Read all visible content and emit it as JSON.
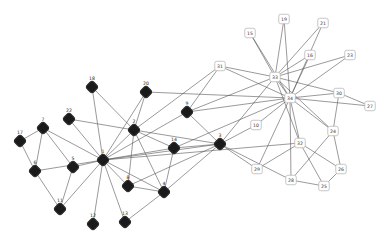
{
  "diagram": {
    "type": "network-graph",
    "colors": {
      "faction_a_fill": "#1a1a1a",
      "faction_b_fill": "#ffffff",
      "faction_b_border": "#b8b8b8",
      "edge": "#555555",
      "background": "#ffffff"
    },
    "nodes": [
      {
        "id": "1",
        "x": 103,
        "y": 160,
        "group": "dark"
      },
      {
        "id": "2",
        "x": 134,
        "y": 130,
        "group": "dark"
      },
      {
        "id": "3",
        "x": 220,
        "y": 144,
        "group": "dark"
      },
      {
        "id": "4",
        "x": 164,
        "y": 192,
        "group": "dark"
      },
      {
        "id": "5",
        "x": 73,
        "y": 167,
        "group": "dark"
      },
      {
        "id": "6",
        "x": 35,
        "y": 171,
        "group": "dark"
      },
      {
        "id": "7",
        "x": 43,
        "y": 128,
        "group": "dark"
      },
      {
        "id": "8",
        "x": 128,
        "y": 186,
        "group": "dark"
      },
      {
        "id": "9",
        "x": 187,
        "y": 112,
        "group": "dark"
      },
      {
        "id": "11",
        "x": 60,
        "y": 209,
        "group": "dark"
      },
      {
        "id": "12",
        "x": 93,
        "y": 224,
        "group": "dark"
      },
      {
        "id": "13",
        "x": 125,
        "y": 222,
        "group": "dark"
      },
      {
        "id": "14",
        "x": 174,
        "y": 148,
        "group": "dark"
      },
      {
        "id": "17",
        "x": 20,
        "y": 141,
        "group": "dark"
      },
      {
        "id": "18",
        "x": 92,
        "y": 87,
        "group": "dark"
      },
      {
        "id": "20",
        "x": 146,
        "y": 92,
        "group": "dark"
      },
      {
        "id": "22",
        "x": 69,
        "y": 119,
        "group": "dark"
      },
      {
        "id": "10",
        "x": 256,
        "y": 125,
        "group": "light"
      },
      {
        "id": "15",
        "x": 250,
        "y": 33,
        "group": "light"
      },
      {
        "id": "16",
        "x": 310,
        "y": 55,
        "group": "light"
      },
      {
        "id": "19",
        "x": 284,
        "y": 19,
        "group": "light"
      },
      {
        "id": "21",
        "x": 323,
        "y": 23,
        "group": "light"
      },
      {
        "id": "23",
        "x": 350,
        "y": 55,
        "group": "light"
      },
      {
        "id": "24",
        "x": 333,
        "y": 131,
        "group": "light"
      },
      {
        "id": "25",
        "x": 324,
        "y": 186,
        "group": "light"
      },
      {
        "id": "26",
        "x": 341,
        "y": 169,
        "group": "light"
      },
      {
        "id": "27",
        "x": 370,
        "y": 106,
        "group": "light"
      },
      {
        "id": "28",
        "x": 291,
        "y": 180,
        "group": "light"
      },
      {
        "id": "29",
        "x": 257,
        "y": 169,
        "group": "light"
      },
      {
        "id": "30",
        "x": 339,
        "y": 93,
        "group": "light"
      },
      {
        "id": "31",
        "x": 220,
        "y": 66,
        "group": "light"
      },
      {
        "id": "32",
        "x": 300,
        "y": 143,
        "group": "light"
      },
      {
        "id": "33",
        "x": 275,
        "y": 77,
        "group": "light"
      },
      {
        "id": "34",
        "x": 290,
        "y": 98,
        "group": "light"
      }
    ],
    "edges": [
      [
        "1",
        "2"
      ],
      [
        "1",
        "3"
      ],
      [
        "1",
        "4"
      ],
      [
        "1",
        "5"
      ],
      [
        "1",
        "6"
      ],
      [
        "1",
        "7"
      ],
      [
        "1",
        "8"
      ],
      [
        "1",
        "9"
      ],
      [
        "1",
        "11"
      ],
      [
        "1",
        "12"
      ],
      [
        "1",
        "13"
      ],
      [
        "1",
        "14"
      ],
      [
        "1",
        "18"
      ],
      [
        "1",
        "20"
      ],
      [
        "1",
        "22"
      ],
      [
        "1",
        "32"
      ],
      [
        "2",
        "3"
      ],
      [
        "2",
        "4"
      ],
      [
        "2",
        "8"
      ],
      [
        "2",
        "14"
      ],
      [
        "2",
        "18"
      ],
      [
        "2",
        "20"
      ],
      [
        "2",
        "22"
      ],
      [
        "2",
        "31"
      ],
      [
        "3",
        "4"
      ],
      [
        "3",
        "8"
      ],
      [
        "3",
        "9"
      ],
      [
        "3",
        "10"
      ],
      [
        "3",
        "14"
      ],
      [
        "3",
        "28"
      ],
      [
        "3",
        "29"
      ],
      [
        "3",
        "33"
      ],
      [
        "4",
        "8"
      ],
      [
        "4",
        "13"
      ],
      [
        "4",
        "14"
      ],
      [
        "5",
        "7"
      ],
      [
        "5",
        "11"
      ],
      [
        "6",
        "7"
      ],
      [
        "6",
        "11"
      ],
      [
        "6",
        "17"
      ],
      [
        "7",
        "17"
      ],
      [
        "9",
        "31"
      ],
      [
        "9",
        "33"
      ],
      [
        "9",
        "34"
      ],
      [
        "10",
        "34"
      ],
      [
        "14",
        "34"
      ],
      [
        "15",
        "33"
      ],
      [
        "15",
        "34"
      ],
      [
        "16",
        "33"
      ],
      [
        "16",
        "34"
      ],
      [
        "19",
        "33"
      ],
      [
        "19",
        "34"
      ],
      [
        "20",
        "34"
      ],
      [
        "21",
        "33"
      ],
      [
        "21",
        "34"
      ],
      [
        "23",
        "33"
      ],
      [
        "23",
        "34"
      ],
      [
        "24",
        "26"
      ],
      [
        "24",
        "28"
      ],
      [
        "24",
        "30"
      ],
      [
        "24",
        "33"
      ],
      [
        "24",
        "34"
      ],
      [
        "25",
        "26"
      ],
      [
        "25",
        "28"
      ],
      [
        "25",
        "32"
      ],
      [
        "26",
        "32"
      ],
      [
        "27",
        "30"
      ],
      [
        "27",
        "34"
      ],
      [
        "28",
        "34"
      ],
      [
        "29",
        "32"
      ],
      [
        "29",
        "34"
      ],
      [
        "30",
        "33"
      ],
      [
        "30",
        "34"
      ],
      [
        "31",
        "33"
      ],
      [
        "31",
        "34"
      ],
      [
        "32",
        "33"
      ],
      [
        "32",
        "34"
      ],
      [
        "33",
        "34"
      ]
    ]
  }
}
